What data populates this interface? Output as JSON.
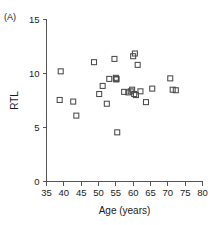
{
  "panel": {
    "label": "(A)"
  },
  "chart_data": {
    "type": "scatter",
    "title": "",
    "xlabel": "Age (years)",
    "ylabel": "RTL",
    "xlim": [
      35,
      80
    ],
    "ylim": [
      0,
      15
    ],
    "xticks": [
      35,
      40,
      45,
      50,
      55,
      60,
      65,
      70,
      75,
      80
    ],
    "yticks": [
      0,
      5,
      10,
      15
    ],
    "xtick_labels": [
      "35",
      "40",
      "45",
      "50",
      "55",
      "60",
      "65",
      "70",
      "75",
      "80"
    ],
    "ytick_labels": [
      "0",
      "5",
      "10",
      "15"
    ],
    "grid": false,
    "legend": null,
    "marker": "open-square",
    "marker_color": "#4a4a4a",
    "n_points": 28,
    "x": [
      39.1,
      38.8,
      42.7,
      43.6,
      48.7,
      50.2,
      51.2,
      52.4,
      53.1,
      54.6,
      55.0,
      55.1,
      55.2,
      55.4,
      57.4,
      58.6,
      59.3,
      59.7,
      60.0,
      60.3,
      60.5,
      60.8,
      61.3,
      62.1,
      63.7,
      65.5,
      70.7,
      71.4,
      72.3
    ],
    "y": [
      10.2,
      7.55,
      7.4,
      6.1,
      11.05,
      8.1,
      8.85,
      7.2,
      9.5,
      11.35,
      9.6,
      9.45,
      9.5,
      4.55,
      8.3,
      8.25,
      8.35,
      8.5,
      11.6,
      8.1,
      11.85,
      8.0,
      10.8,
      8.35,
      7.35,
      8.6,
      9.55,
      8.5,
      8.45
    ]
  }
}
